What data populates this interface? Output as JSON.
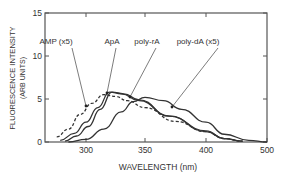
{
  "chart_data": {
    "type": "line",
    "title": "",
    "xlabel": "WAVELENGTH (nm)",
    "ylabel": "FLUORESCENCE INTENSITY",
    "ylabel_sub": "(ARB UNITS)",
    "xlim": [
      265,
      500
    ],
    "ylim": [
      0,
      15
    ],
    "xticks": [
      300,
      350,
      400,
      500
    ],
    "yticks": [
      0,
      5,
      10,
      15
    ],
    "grid": false,
    "legend": "annotations",
    "series": [
      {
        "name": "AMP (x5)",
        "style": "dashed",
        "x": [
          275,
          285,
          295,
          305,
          315,
          325,
          335,
          350,
          375,
          400,
          430,
          460
        ],
        "y": [
          0.6,
          1.5,
          3.2,
          4.5,
          5.5,
          5.3,
          4.8,
          4.0,
          2.4,
          1.2,
          0.4,
          0.1
        ]
      },
      {
        "name": "ApA",
        "style": "solid",
        "x": [
          278,
          290,
          300,
          310,
          320,
          330,
          345,
          370,
          400,
          430,
          460
        ],
        "y": [
          0.2,
          1.0,
          2.3,
          4.0,
          5.8,
          5.6,
          4.8,
          3.0,
          1.3,
          0.4,
          0.1
        ]
      },
      {
        "name": "poly-rA",
        "style": "solid",
        "x": [
          282,
          292,
          302,
          312,
          322,
          332,
          345,
          370,
          400,
          430,
          460
        ],
        "y": [
          0.1,
          0.7,
          1.8,
          3.8,
          5.8,
          5.6,
          4.9,
          3.0,
          1.2,
          0.4,
          0.1
        ]
      },
      {
        "name": "poly-dA (x5)",
        "style": "solid",
        "x": [
          285,
          300,
          315,
          330,
          340,
          350,
          365,
          380,
          400,
          430,
          470,
          500
        ],
        "y": [
          0.0,
          0.3,
          1.5,
          3.5,
          4.7,
          5.2,
          4.8,
          3.8,
          2.3,
          0.9,
          0.2,
          0.0
        ]
      }
    ],
    "annotations": [
      "AMP (x5)",
      "ApA",
      "poly-rA",
      "poly-dA (x5)"
    ]
  }
}
